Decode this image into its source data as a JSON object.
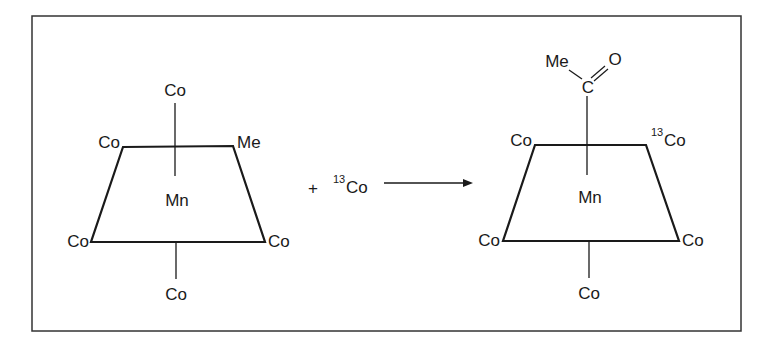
{
  "diagram": {
    "type": "chemical-reaction",
    "reactant": {
      "center": "Mn",
      "ligands": {
        "top": "Co",
        "top_left": "Co",
        "top_right": "Me",
        "bottom_left": "Co",
        "bottom_right": "Co",
        "bottom": "Co"
      }
    },
    "plus": "+",
    "reagent": {
      "isotope": "13",
      "symbol": "Co"
    },
    "arrow": "reaction-arrow",
    "product": {
      "center": "Mn",
      "acyl": {
        "me": "Me",
        "c": "C",
        "o": "O"
      },
      "ligands": {
        "top_left": "Co",
        "top_right_isotope": "13",
        "top_right": "Co",
        "bottom_left": "Co",
        "bottom_right": "Co",
        "bottom": "Co"
      }
    }
  }
}
